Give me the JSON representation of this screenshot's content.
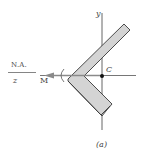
{
  "figure": {
    "caption": "(a)",
    "labels": {
      "neutral_axis": "N.A.",
      "z_axis": "z",
      "moment": "M",
      "y_axis": "y",
      "centroid": "C"
    },
    "colors": {
      "section_fill": "#d4d4d4",
      "section_stroke": "#3a3a3a",
      "axis_stroke": "#555555",
      "arrow": "#7a7a7a",
      "centroid_dot": "#111111"
    }
  }
}
